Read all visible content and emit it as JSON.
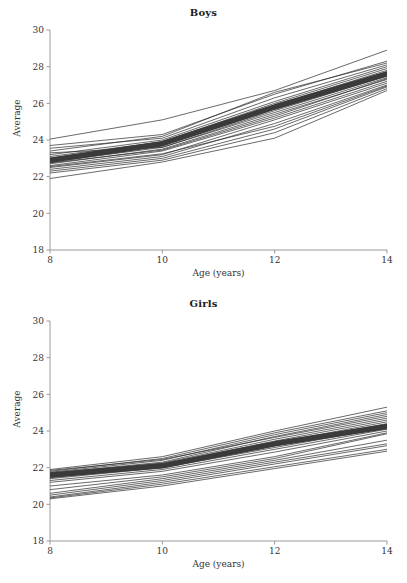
{
  "figure": {
    "background_color": "#ffffff",
    "axis_color": "#9a9a9a",
    "line_color": "#2a2a2a",
    "mean_line_color": "#3a3a3a",
    "text_color": "#333333"
  },
  "panels": [
    {
      "id": "boys",
      "title": "Boys",
      "xlabel": "Age (years)",
      "ylabel": "Average"
    },
    {
      "id": "girls",
      "title": "Girls",
      "xlabel": "Age (years)",
      "ylabel": "Average"
    }
  ],
  "chart_data": [
    {
      "type": "line",
      "title": "Boys",
      "xlabel": "Age (years)",
      "ylabel": "Average",
      "xlim": [
        8,
        14
      ],
      "ylim": [
        18,
        30
      ],
      "xticks": [
        8,
        10,
        12,
        14
      ],
      "yticks": [
        18,
        20,
        22,
        24,
        26,
        28,
        30
      ],
      "xtick_labels": [
        "8",
        "10",
        "12",
        "14"
      ],
      "ytick_labels": [
        "18",
        "20",
        "22",
        "24",
        "26",
        "28",
        "30"
      ],
      "grid": false,
      "legend": "none",
      "x": [
        8,
        10,
        12,
        14
      ],
      "series": [
        {
          "name": "mean",
          "emphasis": "thick",
          "values": [
            22.9,
            23.8,
            25.8,
            27.6
          ]
        },
        {
          "name": "subject-01",
          "values": [
            24.05,
            25.1,
            26.7,
            28.9
          ]
        },
        {
          "name": "subject-02",
          "values": [
            23.7,
            24.3,
            26.5,
            28.3
          ]
        },
        {
          "name": "subject-03",
          "values": [
            23.4,
            24.2,
            26.6,
            28.2
          ]
        },
        {
          "name": "subject-04",
          "values": [
            23.2,
            24.0,
            26.1,
            28.0
          ]
        },
        {
          "name": "subject-05",
          "values": [
            23.1,
            23.9,
            25.9,
            27.8
          ]
        },
        {
          "name": "subject-06",
          "values": [
            23.0,
            23.9,
            26.0,
            27.9
          ]
        },
        {
          "name": "subject-07",
          "values": [
            22.9,
            23.8,
            25.7,
            27.6
          ]
        },
        {
          "name": "subject-08",
          "values": [
            22.8,
            23.6,
            25.5,
            27.4
          ]
        },
        {
          "name": "subject-09",
          "values": [
            22.7,
            23.5,
            25.4,
            27.3
          ]
        },
        {
          "name": "subject-10",
          "values": [
            22.6,
            23.4,
            25.2,
            27.2
          ]
        },
        {
          "name": "subject-11",
          "values": [
            22.5,
            23.2,
            25.1,
            27.1
          ]
        },
        {
          "name": "subject-12",
          "values": [
            22.4,
            23.1,
            24.9,
            27.0
          ]
        },
        {
          "name": "subject-13",
          "values": [
            22.3,
            23.0,
            24.6,
            26.9
          ]
        },
        {
          "name": "subject-14",
          "values": [
            22.2,
            22.9,
            24.4,
            26.8
          ]
        },
        {
          "name": "subject-15",
          "values": [
            21.9,
            22.8,
            24.1,
            26.7
          ]
        },
        {
          "name": "subject-16",
          "values": [
            23.3,
            23.6,
            25.6,
            27.5
          ]
        },
        {
          "name": "subject-17",
          "values": [
            22.95,
            23.7,
            25.85,
            27.7
          ]
        },
        {
          "name": "subject-18",
          "values": [
            22.75,
            23.45,
            25.3,
            27.35
          ]
        },
        {
          "name": "subject-19",
          "values": [
            23.55,
            24.1,
            26.3,
            28.1
          ]
        },
        {
          "name": "subject-20",
          "values": [
            22.55,
            23.25,
            24.75,
            26.95
          ]
        }
      ]
    },
    {
      "type": "line",
      "title": "Girls",
      "xlabel": "Age (years)",
      "ylabel": "Average",
      "xlim": [
        8,
        14
      ],
      "ylim": [
        18,
        30
      ],
      "xticks": [
        8,
        10,
        12,
        14
      ],
      "yticks": [
        18,
        20,
        22,
        24,
        26,
        28,
        30
      ],
      "xtick_labels": [
        "8",
        "10",
        "12",
        "14"
      ],
      "ytick_labels": [
        "18",
        "20",
        "22",
        "24",
        "26",
        "28",
        "30"
      ],
      "grid": false,
      "legend": "none",
      "x": [
        8,
        10,
        12,
        14
      ],
      "series": [
        {
          "name": "mean",
          "emphasis": "thick",
          "values": [
            21.6,
            22.1,
            23.3,
            24.25
          ]
        },
        {
          "name": "subject-01",
          "values": [
            21.9,
            22.6,
            24.0,
            25.3
          ]
        },
        {
          "name": "subject-02",
          "values": [
            21.8,
            22.5,
            23.9,
            25.1
          ]
        },
        {
          "name": "subject-03",
          "values": [
            21.75,
            22.4,
            23.8,
            25.0
          ]
        },
        {
          "name": "subject-04",
          "values": [
            21.7,
            22.3,
            23.7,
            24.9
          ]
        },
        {
          "name": "subject-05",
          "values": [
            21.65,
            22.25,
            23.55,
            24.7
          ]
        },
        {
          "name": "subject-06",
          "values": [
            21.6,
            22.2,
            23.45,
            24.6
          ]
        },
        {
          "name": "subject-07",
          "values": [
            21.55,
            22.15,
            23.35,
            24.5
          ]
        },
        {
          "name": "subject-08",
          "values": [
            21.5,
            22.1,
            23.3,
            24.4
          ]
        },
        {
          "name": "subject-09",
          "values": [
            21.45,
            22.05,
            23.2,
            24.3
          ]
        },
        {
          "name": "subject-10",
          "values": [
            21.4,
            22.0,
            23.1,
            24.2
          ]
        },
        {
          "name": "subject-11",
          "values": [
            21.3,
            21.9,
            23.0,
            24.1
          ]
        },
        {
          "name": "subject-12",
          "values": [
            21.2,
            21.8,
            22.85,
            24.0
          ]
        },
        {
          "name": "subject-13",
          "values": [
            21.0,
            21.6,
            22.6,
            23.9
          ]
        },
        {
          "name": "subject-14",
          "values": [
            20.8,
            21.5,
            22.5,
            23.85
          ]
        },
        {
          "name": "subject-15",
          "values": [
            20.6,
            21.4,
            22.4,
            23.5
          ]
        },
        {
          "name": "subject-16",
          "values": [
            20.5,
            21.3,
            22.3,
            23.3
          ]
        },
        {
          "name": "subject-17",
          "values": [
            20.4,
            21.2,
            22.2,
            23.2
          ]
        },
        {
          "name": "subject-18",
          "values": [
            20.35,
            21.1,
            22.05,
            23.0
          ]
        },
        {
          "name": "subject-19",
          "values": [
            20.3,
            21.0,
            21.95,
            22.9
          ]
        },
        {
          "name": "subject-20",
          "values": [
            21.85,
            22.45,
            23.65,
            24.8
          ]
        }
      ]
    }
  ]
}
